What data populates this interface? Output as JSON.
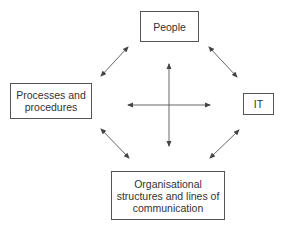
{
  "diagram": {
    "type": "relationship-diagram",
    "nodes": [
      {
        "id": "people",
        "label": "People",
        "position": "top"
      },
      {
        "id": "processes",
        "label": "Processes and\nprocedures",
        "position": "left"
      },
      {
        "id": "it",
        "label": "IT",
        "position": "right"
      },
      {
        "id": "org",
        "label": "Organisational\nstructures and lines of\ncommunication",
        "position": "bottom"
      }
    ],
    "edges": [
      {
        "from": "people",
        "to": "processes",
        "style": "bidirectional-arrow"
      },
      {
        "from": "people",
        "to": "it",
        "style": "bidirectional-arrow"
      },
      {
        "from": "processes",
        "to": "org",
        "style": "bidirectional-arrow"
      },
      {
        "from": "it",
        "to": "org",
        "style": "bidirectional-arrow"
      },
      {
        "from": "people",
        "to": "org",
        "style": "bidirectional-arrow",
        "note": "central vertical"
      },
      {
        "from": "processes",
        "to": "it",
        "style": "bidirectional-arrow",
        "note": "central horizontal"
      }
    ],
    "colors": {
      "line": "#555555",
      "box_border": "#555555",
      "text": "#333333",
      "background": "#ffffff"
    }
  }
}
